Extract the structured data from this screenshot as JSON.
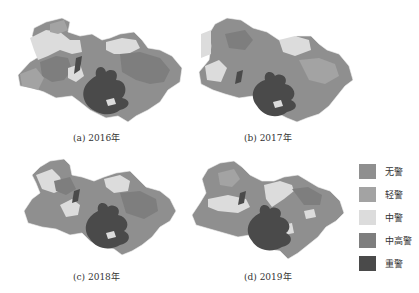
{
  "figure": {
    "panels": [
      {
        "id": "a",
        "caption": "(a)  2016年",
        "year": "2016"
      },
      {
        "id": "b",
        "caption": "(b)  2017年",
        "year": "2017"
      },
      {
        "id": "c",
        "caption": "(c)  2018年",
        "year": "2018"
      },
      {
        "id": "d",
        "caption": "(d)  2019年",
        "year": "2019"
      }
    ],
    "legend": {
      "items": [
        {
          "label": "无警",
          "color": "#8f8f8f"
        },
        {
          "label": "轻警",
          "color": "#a3a3a3"
        },
        {
          "label": "中警",
          "color": "#dcdcdc"
        },
        {
          "label": "中高警",
          "color": "#7e7e7e"
        },
        {
          "label": "重警",
          "color": "#4a4a4a"
        }
      ]
    }
  }
}
